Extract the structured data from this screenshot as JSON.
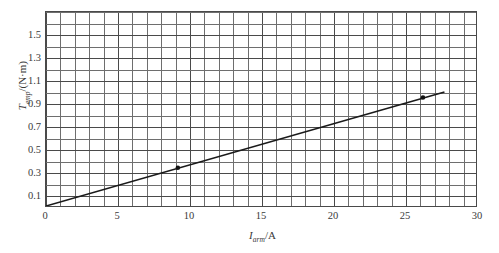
{
  "chart_data": {
    "type": "line",
    "title": "",
    "subtitle": "",
    "xlabel_symbol": "I",
    "xlabel_subscript": "arm",
    "xlabel_unit": "/A",
    "xlabel": "I_arm/A",
    "ylabel_symbol": "T",
    "ylabel_subscript": "emp",
    "ylabel_unit": "/(N·m)",
    "ylabel": "T_emp/(N·m)",
    "xlim": [
      0,
      30.0
    ],
    "ylim": [
      0,
      1.7
    ],
    "x_major_ticks": [
      0,
      5,
      10,
      15,
      20,
      25,
      30
    ],
    "x_major_tick_labels": [
      "0",
      "5",
      "10",
      "15",
      "20",
      "25",
      "30"
    ],
    "x_minor_step": 1,
    "y_major_ticks": [
      0.1,
      0.3,
      0.5,
      0.7,
      0.9,
      1.1,
      1.3,
      1.5
    ],
    "y_major_tick_labels": [
      "0.1",
      "0.3",
      "0.5",
      "0.7",
      "0.9",
      "1.1",
      "1.3",
      "1.5"
    ],
    "y_minor_step": 0.1,
    "grid": true,
    "grid_color": "#6e6e6e",
    "axis_color": "#4a4a4a",
    "legend": "none",
    "series": [
      {
        "name": "torque vs armature current",
        "type": "line",
        "color": "#1a1a1a",
        "line_width": 1.6,
        "x": [
          0.0,
          27.8
        ],
        "y": [
          0.0,
          1.0
        ],
        "slope": 0.036,
        "intercept": 0.0
      },
      {
        "name": "measured points",
        "type": "scatter",
        "color": "#111111",
        "marker": "dot",
        "x": [
          9.2,
          26.3
        ],
        "y": [
          0.335,
          0.95
        ]
      }
    ]
  }
}
